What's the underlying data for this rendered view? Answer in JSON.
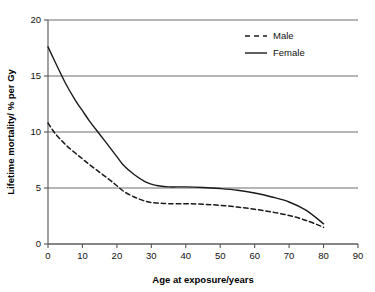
{
  "chart_data": {
    "type": "line",
    "title": "",
    "xlabel": "Age at exposure/years",
    "ylabel": "Lifetime mortality/ % per Gy",
    "xlim": [
      0,
      90
    ],
    "ylim": [
      0,
      20
    ],
    "xticks": [
      0,
      10,
      20,
      30,
      40,
      50,
      60,
      70,
      80,
      90
    ],
    "yticks": [
      0,
      5,
      10,
      15,
      20
    ],
    "xtick_labels": [
      "0",
      "10",
      "20",
      "30",
      "40",
      "50",
      "60",
      "70",
      "80",
      "90"
    ],
    "ytick_labels": [
      "0",
      "5",
      "10",
      "15",
      "20"
    ],
    "grid": "horizontal",
    "legend_position": "top-right",
    "x": [
      0,
      2,
      5,
      8,
      10,
      12,
      15,
      18,
      20,
      22,
      25,
      28,
      30,
      32,
      35,
      40,
      45,
      50,
      55,
      60,
      65,
      70,
      75,
      80
    ],
    "series": [
      {
        "name": "Male",
        "style": "dashed",
        "color": "#1a1a1a",
        "values": [
          10.8,
          9.9,
          8.9,
          8.1,
          7.6,
          7.1,
          6.4,
          5.7,
          5.2,
          4.7,
          4.2,
          3.85,
          3.7,
          3.65,
          3.6,
          3.6,
          3.55,
          3.45,
          3.3,
          3.1,
          2.85,
          2.55,
          2.1,
          1.5
        ]
      },
      {
        "name": "Female",
        "style": "solid",
        "color": "#1a1a1a",
        "values": [
          17.6,
          16.3,
          14.4,
          12.8,
          11.9,
          11.0,
          9.8,
          8.6,
          7.8,
          7.0,
          6.2,
          5.6,
          5.35,
          5.2,
          5.1,
          5.1,
          5.05,
          4.95,
          4.8,
          4.55,
          4.2,
          3.75,
          3.0,
          1.8
        ]
      }
    ],
    "legend": [
      {
        "label": "Male",
        "style": "dashed"
      },
      {
        "label": "Female",
        "style": "solid"
      }
    ],
    "annotations": []
  },
  "plot_geometry": {
    "left": 48,
    "right": 358,
    "top": 20,
    "bottom": 244
  }
}
